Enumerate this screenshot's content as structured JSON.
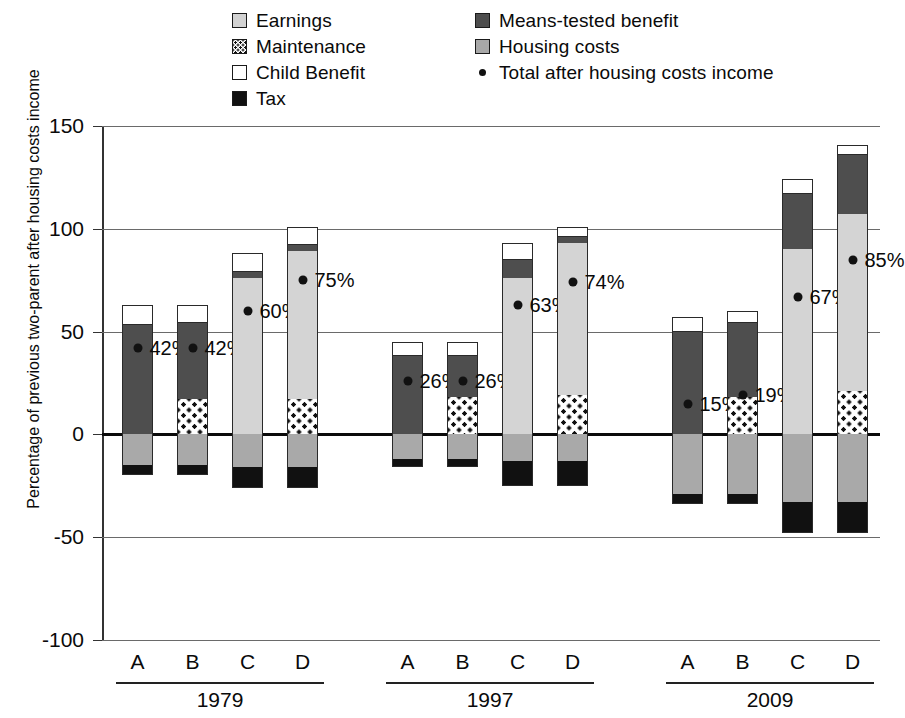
{
  "legend": {
    "left_column": [
      {
        "key": "earnings",
        "label": "Earnings",
        "swatch": "earnings-swatch",
        "color": "#d4d4d4"
      },
      {
        "key": "maintenance",
        "label": "Maintenance",
        "swatch": "maintenance-swatch",
        "color": "#ffffff"
      },
      {
        "key": "child_benefit",
        "label": "Child Benefit",
        "swatch": "child-benefit-swatch",
        "color": "#ffffff"
      },
      {
        "key": "tax",
        "label": "Tax",
        "swatch": "tax-swatch",
        "color": "#111111"
      }
    ],
    "right_column": [
      {
        "key": "means_tested",
        "label": "Means-tested benefit",
        "swatch": "means-tested-swatch",
        "color": "#4e4e4e"
      },
      {
        "key": "housing_costs",
        "label": "Housing costs",
        "swatch": "housing-costs-swatch",
        "color": "#a9a9a9"
      },
      {
        "key": "total",
        "label": "Total after housing costs income",
        "swatch": "total-dot-marker",
        "color": "#111111"
      }
    ]
  },
  "chart_data": {
    "type": "bar",
    "subtype": "stacked-bar-with-point-overlay",
    "title": "",
    "xlabel": "",
    "ylabel": "Percentage of previous two-parent after housing costs income",
    "ylim": [
      -100,
      150
    ],
    "yticks": [
      150,
      100,
      50,
      0,
      -50,
      -100
    ],
    "ytick_labels": [
      "150",
      "100",
      "50",
      "0",
      "-50",
      "-100"
    ],
    "grid": true,
    "legend_position": "top",
    "groups": [
      "1979",
      "1997",
      "2009"
    ],
    "categories": [
      "A",
      "B",
      "C",
      "D"
    ],
    "series": [
      {
        "name": "Earnings",
        "key": "earnings",
        "color": "#d4d4d4"
      },
      {
        "name": "Maintenance",
        "key": "maintenance",
        "color": "#ffffff"
      },
      {
        "name": "Child Benefit",
        "key": "child_benefit",
        "color": "#ffffff"
      },
      {
        "name": "Tax",
        "key": "tax",
        "color": "#111111"
      },
      {
        "name": "Means-tested benefit",
        "key": "means_tested",
        "color": "#4e4e4e"
      },
      {
        "name": "Housing costs",
        "key": "housing_costs",
        "color": "#a9a9a9"
      }
    ],
    "point_series": {
      "name": "Total after housing costs income",
      "color": "#111111"
    },
    "bars": [
      {
        "group": "1979",
        "category": "A",
        "total_label": "42%",
        "total_value": 42,
        "segments": [
          {
            "key": "means_tested",
            "from": 0,
            "to": 53
          },
          {
            "key": "child_benefit",
            "from": 53,
            "to": 63
          },
          {
            "key": "housing_costs",
            "from": 0,
            "to": -15
          },
          {
            "key": "tax",
            "from": -15,
            "to": -20
          }
        ]
      },
      {
        "group": "1979",
        "category": "B",
        "total_label": "42%",
        "total_value": 42,
        "segments": [
          {
            "key": "maintenance",
            "from": 0,
            "to": 17
          },
          {
            "key": "means_tested",
            "from": 17,
            "to": 54
          },
          {
            "key": "child_benefit",
            "from": 54,
            "to": 63
          },
          {
            "key": "housing_costs",
            "from": 0,
            "to": -15
          },
          {
            "key": "tax",
            "from": -15,
            "to": -20
          }
        ]
      },
      {
        "group": "1979",
        "category": "C",
        "total_label": "60%",
        "total_value": 60,
        "segments": [
          {
            "key": "earnings",
            "from": 0,
            "to": 76
          },
          {
            "key": "means_tested",
            "from": 76,
            "to": 79
          },
          {
            "key": "child_benefit",
            "from": 79,
            "to": 88
          },
          {
            "key": "housing_costs",
            "from": 0,
            "to": -16
          },
          {
            "key": "tax",
            "from": -16,
            "to": -26
          }
        ]
      },
      {
        "group": "1979",
        "category": "D",
        "total_label": "75%",
        "total_value": 75,
        "segments": [
          {
            "key": "maintenance",
            "from": 0,
            "to": 17
          },
          {
            "key": "earnings",
            "from": 17,
            "to": 89
          },
          {
            "key": "means_tested",
            "from": 89,
            "to": 92
          },
          {
            "key": "child_benefit",
            "from": 92,
            "to": 101
          },
          {
            "key": "housing_costs",
            "from": 0,
            "to": -16
          },
          {
            "key": "tax",
            "from": -16,
            "to": -26
          }
        ]
      },
      {
        "group": "1997",
        "category": "A",
        "total_label": "26%",
        "total_value": 26,
        "segments": [
          {
            "key": "means_tested",
            "from": 0,
            "to": 38
          },
          {
            "key": "child_benefit",
            "from": 38,
            "to": 45
          },
          {
            "key": "housing_costs",
            "from": 0,
            "to": -12
          },
          {
            "key": "tax",
            "from": -12,
            "to": -16
          }
        ]
      },
      {
        "group": "1997",
        "category": "B",
        "total_label": "26%",
        "total_value": 26,
        "segments": [
          {
            "key": "maintenance",
            "from": 0,
            "to": 18
          },
          {
            "key": "means_tested",
            "from": 18,
            "to": 38
          },
          {
            "key": "child_benefit",
            "from": 38,
            "to": 45
          },
          {
            "key": "housing_costs",
            "from": 0,
            "to": -12
          },
          {
            "key": "tax",
            "from": -12,
            "to": -16
          }
        ]
      },
      {
        "group": "1997",
        "category": "C",
        "total_label": "63%",
        "total_value": 63,
        "segments": [
          {
            "key": "earnings",
            "from": 0,
            "to": 76
          },
          {
            "key": "means_tested",
            "from": 76,
            "to": 85
          },
          {
            "key": "child_benefit",
            "from": 85,
            "to": 93
          },
          {
            "key": "housing_costs",
            "from": 0,
            "to": -13
          },
          {
            "key": "tax",
            "from": -13,
            "to": -25
          }
        ]
      },
      {
        "group": "1997",
        "category": "D",
        "total_label": "74%",
        "total_value": 74,
        "segments": [
          {
            "key": "maintenance",
            "from": 0,
            "to": 19
          },
          {
            "key": "earnings",
            "from": 19,
            "to": 93
          },
          {
            "key": "means_tested",
            "from": 93,
            "to": 96
          },
          {
            "key": "child_benefit",
            "from": 96,
            "to": 101
          },
          {
            "key": "housing_costs",
            "from": 0,
            "to": -13
          },
          {
            "key": "tax",
            "from": -13,
            "to": -25
          }
        ]
      },
      {
        "group": "2009",
        "category": "A",
        "total_label": "15%",
        "total_value": 15,
        "segments": [
          {
            "key": "means_tested",
            "from": 0,
            "to": 50
          },
          {
            "key": "child_benefit",
            "from": 50,
            "to": 57
          },
          {
            "key": "housing_costs",
            "from": 0,
            "to": -29
          },
          {
            "key": "tax",
            "from": -29,
            "to": -34
          }
        ]
      },
      {
        "group": "2009",
        "category": "B",
        "total_label": "19%",
        "total_value": 19,
        "segments": [
          {
            "key": "maintenance",
            "from": 0,
            "to": 18
          },
          {
            "key": "means_tested",
            "from": 18,
            "to": 54
          },
          {
            "key": "child_benefit",
            "from": 54,
            "to": 60
          },
          {
            "key": "housing_costs",
            "from": 0,
            "to": -29
          },
          {
            "key": "tax",
            "from": -29,
            "to": -34
          }
        ]
      },
      {
        "group": "2009",
        "category": "C",
        "total_label": "67%",
        "total_value": 67,
        "segments": [
          {
            "key": "earnings",
            "from": 0,
            "to": 90
          },
          {
            "key": "means_tested",
            "from": 90,
            "to": 117
          },
          {
            "key": "child_benefit",
            "from": 117,
            "to": 124
          },
          {
            "key": "housing_costs",
            "from": 0,
            "to": -33
          },
          {
            "key": "tax",
            "from": -33,
            "to": -48
          }
        ]
      },
      {
        "group": "2009",
        "category": "D",
        "total_label": "85%",
        "total_value": 85,
        "segments": [
          {
            "key": "maintenance",
            "from": 0,
            "to": 21
          },
          {
            "key": "earnings",
            "from": 21,
            "to": 107
          },
          {
            "key": "means_tested",
            "from": 107,
            "to": 136
          },
          {
            "key": "child_benefit",
            "from": 136,
            "to": 141
          },
          {
            "key": "housing_costs",
            "from": 0,
            "to": -33
          },
          {
            "key": "tax",
            "from": -33,
            "to": -48
          }
        ]
      }
    ]
  }
}
